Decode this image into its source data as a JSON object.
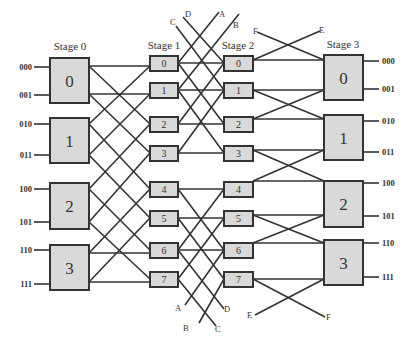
{
  "stages": [
    {
      "label": "Stage 0",
      "switches": [
        "0",
        "1",
        "2",
        "3"
      ]
    },
    {
      "label": "Stage 1",
      "switches": [
        "0",
        "1",
        "2",
        "3",
        "4",
        "5",
        "6",
        "7"
      ]
    },
    {
      "label": "Stage 2",
      "switches": [
        "0",
        "1",
        "2",
        "3",
        "4",
        "5",
        "6",
        "7"
      ]
    },
    {
      "label": "Stage 3",
      "switches": [
        "0",
        "1",
        "2",
        "3"
      ]
    }
  ],
  "inputs": [
    "000",
    "001",
    "010",
    "011",
    "100",
    "101",
    "110",
    "111"
  ],
  "outputs": [
    "000",
    "001",
    "010",
    "011",
    "100",
    "101",
    "110",
    "111"
  ],
  "wrap_labels": {
    "top": [
      "C",
      "D",
      "A",
      "B",
      "F",
      "E"
    ],
    "bottom": [
      "A",
      "B",
      "C",
      "D",
      "E",
      "F"
    ]
  },
  "colors": {
    "box_fill": "#d9d9d9",
    "stroke": "#333333"
  }
}
